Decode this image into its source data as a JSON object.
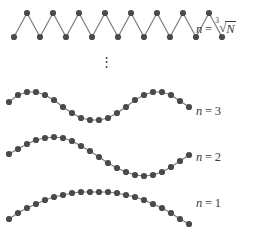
{
  "figure": {
    "background_color": "#ffffff",
    "dot_color": "#4a4a4a",
    "line_color": "#7a7a7a",
    "text_color": "#3b3b3b",
    "width": 260,
    "height": 238
  },
  "ellipsis": {
    "symbol": "⋮",
    "x": 100,
    "y": 55
  },
  "labels": {
    "row_top": {
      "variable": "n",
      "equals": "=",
      "value": "∛̅N̅",
      "radical_index": "3",
      "radical_sign": "√",
      "radicand": "N",
      "full_text": "n = ∛(N)",
      "x": 196,
      "y": 21
    },
    "row_three": {
      "variable": "n",
      "equals": "=",
      "value": "3",
      "full_text": "n = 3",
      "x": 196,
      "y": 104
    },
    "row_two": {
      "variable": "n",
      "equals": "=",
      "value": "2",
      "full_text": "n = 2",
      "x": 196,
      "y": 150
    },
    "row_one": {
      "variable": "n",
      "equals": "=",
      "value": "1",
      "full_text": "n = 1",
      "x": 196,
      "y": 196
    }
  },
  "chart_data": {
    "type": "scatter",
    "xlabel": "",
    "ylabel": "",
    "grid": false,
    "legend_position": "right",
    "series": [
      {
        "name": "n = cube root of N",
        "label": "n = ∛(N)",
        "mode": "zigzag",
        "dot_count": 17,
        "baseline_y": 25,
        "amplitude": 12,
        "points": [
          {
            "x": 14,
            "y": 37
          },
          {
            "x": 27,
            "y": 13
          },
          {
            "x": 40,
            "y": 37
          },
          {
            "x": 53,
            "y": 13
          },
          {
            "x": 66,
            "y": 37
          },
          {
            "x": 79,
            "y": 13
          },
          {
            "x": 92,
            "y": 37
          },
          {
            "x": 105,
            "y": 13
          },
          {
            "x": 118,
            "y": 37
          },
          {
            "x": 131,
            "y": 13
          },
          {
            "x": 144,
            "y": 37
          },
          {
            "x": 157,
            "y": 13
          },
          {
            "x": 170,
            "y": 37
          },
          {
            "x": 183,
            "y": 13
          },
          {
            "x": 196,
            "y": 37
          },
          {
            "x": 209,
            "y": 13
          },
          {
            "x": 222,
            "y": 37
          }
        ]
      },
      {
        "name": "n = 3",
        "label": "n = 3",
        "mode": "sine-1.5-periods",
        "dot_count": 21,
        "baseline_y": 106,
        "amplitude": 14,
        "periods": 1.5,
        "points": [
          {
            "x": 9,
            "y": 102
          },
          {
            "x": 18,
            "y": 95
          },
          {
            "x": 27,
            "y": 92
          },
          {
            "x": 36,
            "y": 92
          },
          {
            "x": 45,
            "y": 95
          },
          {
            "x": 54,
            "y": 100
          },
          {
            "x": 63,
            "y": 107
          },
          {
            "x": 72,
            "y": 113
          },
          {
            "x": 81,
            "y": 118
          },
          {
            "x": 90,
            "y": 120
          },
          {
            "x": 99,
            "y": 120
          },
          {
            "x": 108,
            "y": 118
          },
          {
            "x": 117,
            "y": 113
          },
          {
            "x": 126,
            "y": 107
          },
          {
            "x": 135,
            "y": 100
          },
          {
            "x": 144,
            "y": 95
          },
          {
            "x": 153,
            "y": 92
          },
          {
            "x": 162,
            "y": 92
          },
          {
            "x": 171,
            "y": 95
          },
          {
            "x": 180,
            "y": 101
          },
          {
            "x": 189,
            "y": 107
          }
        ]
      },
      {
        "name": "n = 2",
        "label": "n = 2",
        "mode": "sine-1-period",
        "dot_count": 21,
        "baseline_y": 156,
        "amplitude": 16,
        "periods": 1.0,
        "points": [
          {
            "x": 9,
            "y": 154
          },
          {
            "x": 18,
            "y": 149
          },
          {
            "x": 27,
            "y": 144
          },
          {
            "x": 36,
            "y": 140
          },
          {
            "x": 45,
            "y": 138
          },
          {
            "x": 54,
            "y": 137
          },
          {
            "x": 63,
            "y": 138
          },
          {
            "x": 72,
            "y": 141
          },
          {
            "x": 81,
            "y": 146
          },
          {
            "x": 90,
            "y": 151
          },
          {
            "x": 99,
            "y": 157
          },
          {
            "x": 108,
            "y": 163
          },
          {
            "x": 117,
            "y": 168
          },
          {
            "x": 126,
            "y": 172
          },
          {
            "x": 135,
            "y": 175
          },
          {
            "x": 144,
            "y": 176
          },
          {
            "x": 153,
            "y": 175
          },
          {
            "x": 162,
            "y": 172
          },
          {
            "x": 171,
            "y": 167
          },
          {
            "x": 180,
            "y": 161
          },
          {
            "x": 189,
            "y": 155
          }
        ]
      },
      {
        "name": "n = 1",
        "label": "n = 1",
        "mode": "sine-half-period",
        "dot_count": 21,
        "baseline_y": 213,
        "amplitude": 21,
        "periods": 0.5,
        "points": [
          {
            "x": 9,
            "y": 219
          },
          {
            "x": 18,
            "y": 213
          },
          {
            "x": 27,
            "y": 208
          },
          {
            "x": 36,
            "y": 204
          },
          {
            "x": 45,
            "y": 200
          },
          {
            "x": 54,
            "y": 197
          },
          {
            "x": 63,
            "y": 195
          },
          {
            "x": 72,
            "y": 193
          },
          {
            "x": 81,
            "y": 192
          },
          {
            "x": 90,
            "y": 192
          },
          {
            "x": 99,
            "y": 192
          },
          {
            "x": 108,
            "y": 192
          },
          {
            "x": 117,
            "y": 193
          },
          {
            "x": 126,
            "y": 195
          },
          {
            "x": 135,
            "y": 197
          },
          {
            "x": 144,
            "y": 200
          },
          {
            "x": 153,
            "y": 204
          },
          {
            "x": 162,
            "y": 208
          },
          {
            "x": 171,
            "y": 213
          },
          {
            "x": 180,
            "y": 219
          },
          {
            "x": 189,
            "y": 224
          }
        ]
      }
    ]
  }
}
